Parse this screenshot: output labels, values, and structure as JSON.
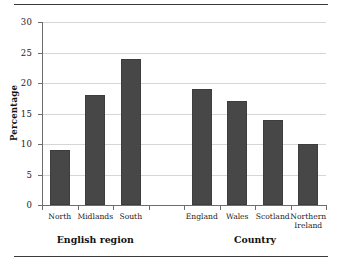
{
  "chart_data": {
    "type": "bar",
    "title": "",
    "xlabel": "",
    "ylabel": "Percentage",
    "ylim": [
      0,
      30
    ],
    "ytick_values": [
      0,
      5,
      10,
      15,
      20,
      25,
      30
    ],
    "ytick_labels": [
      "0",
      "5",
      "10",
      "15",
      "20",
      "25",
      "30"
    ],
    "grid": true,
    "legend": "none",
    "bar_color": "#474747",
    "categories": [
      "North",
      "Midlands",
      "South",
      "England",
      "Wales",
      "Scotland",
      "Northern Ireland"
    ],
    "values": [
      9,
      18,
      24,
      19,
      17,
      14,
      10
    ],
    "groups": [
      {
        "label": "English region",
        "categories": [
          "North",
          "Midlands",
          "South"
        ],
        "values": [
          9,
          18,
          24
        ]
      },
      {
        "label": "Country",
        "categories": [
          "England",
          "Wales",
          "Scotland",
          "Northern Ireland"
        ],
        "values": [
          19,
          17,
          14,
          10
        ]
      }
    ]
  },
  "axis": {
    "y_title": "Percentage"
  },
  "groups": {
    "english_region_label": "English region",
    "country_label": "Country"
  },
  "bars": [
    {
      "label": "North",
      "value": 9
    },
    {
      "label": "Midlands",
      "value": 18
    },
    {
      "label": "South",
      "value": 24
    },
    {
      "label": "England",
      "value": 19
    },
    {
      "label": "Wales",
      "value": 17
    },
    {
      "label": "Scotland",
      "value": 14
    },
    {
      "label": "Northern\nIreland",
      "value": 10
    }
  ],
  "ticks": {
    "y": [
      "0",
      "5",
      "10",
      "15",
      "20",
      "25",
      "30"
    ]
  }
}
